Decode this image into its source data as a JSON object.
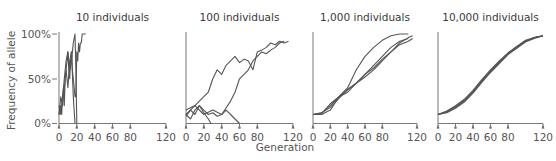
{
  "chart_data": [
    {
      "type": "line",
      "title": "10 individuals",
      "xlabel": "Generation",
      "ylabel": "Frequency of allele",
      "xlim": [
        0,
        120
      ],
      "ylim": [
        0,
        100
      ],
      "xticks": [
        "0",
        "20",
        "40",
        "60",
        "80",
        "120"
      ],
      "yticks": [
        "0%",
        "50%",
        "100%"
      ],
      "series": [
        {
          "name": "run 1",
          "x": [
            0,
            2,
            3,
            4,
            5,
            6,
            7,
            8,
            9,
            10,
            11,
            12,
            13,
            14,
            15,
            16,
            17,
            18,
            19,
            20,
            21,
            22,
            23,
            24,
            25,
            26,
            27,
            28,
            29,
            30
          ],
          "values": [
            10,
            20,
            10,
            30,
            40,
            20,
            50,
            60,
            70,
            80,
            60,
            50,
            70,
            80,
            60,
            50,
            40,
            30,
            30,
            80,
            70,
            90,
            80,
            90,
            90,
            100,
            100,
            100,
            100,
            100
          ]
        },
        {
          "name": "run 2",
          "x": [
            0,
            2,
            4,
            6,
            8,
            10,
            12,
            14,
            16,
            18,
            19,
            20
          ],
          "values": [
            20,
            10,
            30,
            50,
            70,
            80,
            60,
            70,
            90,
            100,
            60,
            0
          ]
        },
        {
          "name": "run 3",
          "x": [
            0,
            2,
            4,
            6,
            8,
            10,
            12,
            14,
            16,
            18
          ],
          "values": [
            10,
            30,
            20,
            40,
            60,
            40,
            70,
            80,
            30,
            0
          ]
        }
      ]
    },
    {
      "type": "line",
      "title": "100 individuals",
      "xlim": [
        0,
        120
      ],
      "ylim": [
        0,
        100
      ],
      "xticks": [
        "0",
        "20",
        "40",
        "60",
        "80",
        "120"
      ],
      "series": [
        {
          "name": "run 1",
          "x": [
            0,
            10,
            20,
            25,
            30,
            35,
            40,
            45,
            50,
            55,
            60,
            65,
            70,
            75,
            80,
            85,
            90,
            95,
            100,
            105,
            110,
            115
          ],
          "values": [
            10,
            20,
            30,
            35,
            50,
            60,
            55,
            65,
            70,
            75,
            68,
            72,
            70,
            60,
            80,
            82,
            85,
            90,
            88,
            92,
            90,
            92
          ]
        },
        {
          "name": "run 2",
          "x": [
            0,
            10,
            20,
            30,
            40,
            50,
            55,
            60,
            65,
            70,
            75,
            80,
            85,
            90,
            95,
            100,
            105,
            110
          ],
          "values": [
            15,
            20,
            10,
            15,
            10,
            25,
            35,
            50,
            55,
            60,
            70,
            75,
            80,
            78,
            82,
            85,
            90,
            92
          ]
        },
        {
          "name": "run 3",
          "x": [
            0,
            5,
            10,
            15,
            20,
            25,
            30,
            35,
            40,
            45,
            50,
            55,
            60
          ],
          "values": [
            10,
            5,
            15,
            20,
            15,
            10,
            12,
            8,
            10,
            15,
            10,
            5,
            0
          ]
        },
        {
          "name": "run 4",
          "x": [
            0,
            5,
            10,
            15,
            20,
            25,
            28
          ],
          "values": [
            8,
            15,
            10,
            20,
            12,
            5,
            0
          ]
        }
      ]
    },
    {
      "type": "line",
      "title": "1,000 individuals",
      "xlim": [
        0,
        120
      ],
      "ylim": [
        0,
        100
      ],
      "xticks": [
        "0",
        "20",
        "40",
        "60",
        "80",
        "120"
      ],
      "series": [
        {
          "name": "run 1",
          "x": [
            0,
            10,
            20,
            30,
            40,
            50,
            60,
            70,
            80,
            90,
            100,
            110
          ],
          "values": [
            10,
            10,
            15,
            30,
            40,
            60,
            75,
            85,
            93,
            98,
            100,
            100
          ]
        },
        {
          "name": "run 2",
          "x": [
            0,
            10,
            20,
            30,
            40,
            50,
            60,
            70,
            80,
            90,
            100,
            110
          ],
          "values": [
            10,
            12,
            20,
            30,
            38,
            45,
            55,
            65,
            75,
            85,
            92,
            95
          ]
        },
        {
          "name": "run 3",
          "x": [
            0,
            10,
            20,
            30,
            40,
            50,
            60,
            70,
            80,
            90,
            100,
            110,
            115
          ],
          "values": [
            10,
            11,
            22,
            30,
            35,
            45,
            52,
            60,
            70,
            80,
            88,
            92,
            95
          ]
        },
        {
          "name": "run 4",
          "x": [
            0,
            10,
            20,
            30,
            40,
            50,
            60,
            70,
            80,
            90,
            100,
            110,
            115
          ],
          "values": [
            10,
            12,
            18,
            28,
            38,
            45,
            55,
            62,
            72,
            80,
            90,
            96,
            98
          ]
        }
      ]
    },
    {
      "type": "line",
      "title": "10,000 individuals",
      "xlim": [
        0,
        120
      ],
      "ylim": [
        0,
        100
      ],
      "xticks": [
        "0",
        "20",
        "40",
        "60",
        "80",
        "120"
      ],
      "series": [
        {
          "name": "run 1",
          "x": [
            0,
            10,
            20,
            30,
            40,
            50,
            60,
            70,
            80,
            90,
            100,
            110,
            120
          ],
          "values": [
            10,
            13,
            18,
            25,
            35,
            47,
            58,
            68,
            78,
            85,
            92,
            96,
            98
          ]
        },
        {
          "name": "run 2",
          "x": [
            0,
            10,
            20,
            30,
            40,
            50,
            60,
            70,
            80,
            90,
            100,
            110,
            120
          ],
          "values": [
            10,
            14,
            20,
            27,
            37,
            49,
            60,
            70,
            79,
            86,
            92,
            96,
            98
          ]
        },
        {
          "name": "run 3",
          "x": [
            0,
            10,
            20,
            30,
            40,
            50,
            60,
            70,
            80,
            90,
            100,
            110,
            120
          ],
          "values": [
            10,
            12,
            17,
            24,
            34,
            46,
            57,
            67,
            77,
            84,
            91,
            95,
            98
          ]
        },
        {
          "name": "run 4",
          "x": [
            0,
            10,
            20,
            30,
            40,
            50,
            60,
            70,
            80,
            90,
            100,
            110,
            120
          ],
          "values": [
            10,
            13,
            19,
            26,
            36,
            48,
            59,
            69,
            78,
            86,
            93,
            96,
            98
          ]
        }
      ]
    }
  ],
  "labels": {
    "panel_titles": [
      "10 individuals",
      "100 individuals",
      "1,000 individuals",
      "10,000 individuals"
    ],
    "ylabel": "Frequency of allele",
    "xlabel": "Generation",
    "yticks": [
      "0%",
      "50%",
      "100%"
    ],
    "xticks": [
      "0",
      "20",
      "40",
      "60",
      "80",
      "120"
    ]
  }
}
